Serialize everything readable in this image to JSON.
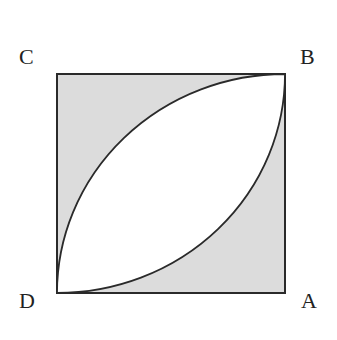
{
  "diagram": {
    "labels": {
      "C": "C",
      "B": "B",
      "D": "D",
      "A": "A"
    },
    "colors": {
      "shaded": "#dcdcdc",
      "stroke": "#2a2a2a",
      "lens": "#ffffff"
    }
  }
}
